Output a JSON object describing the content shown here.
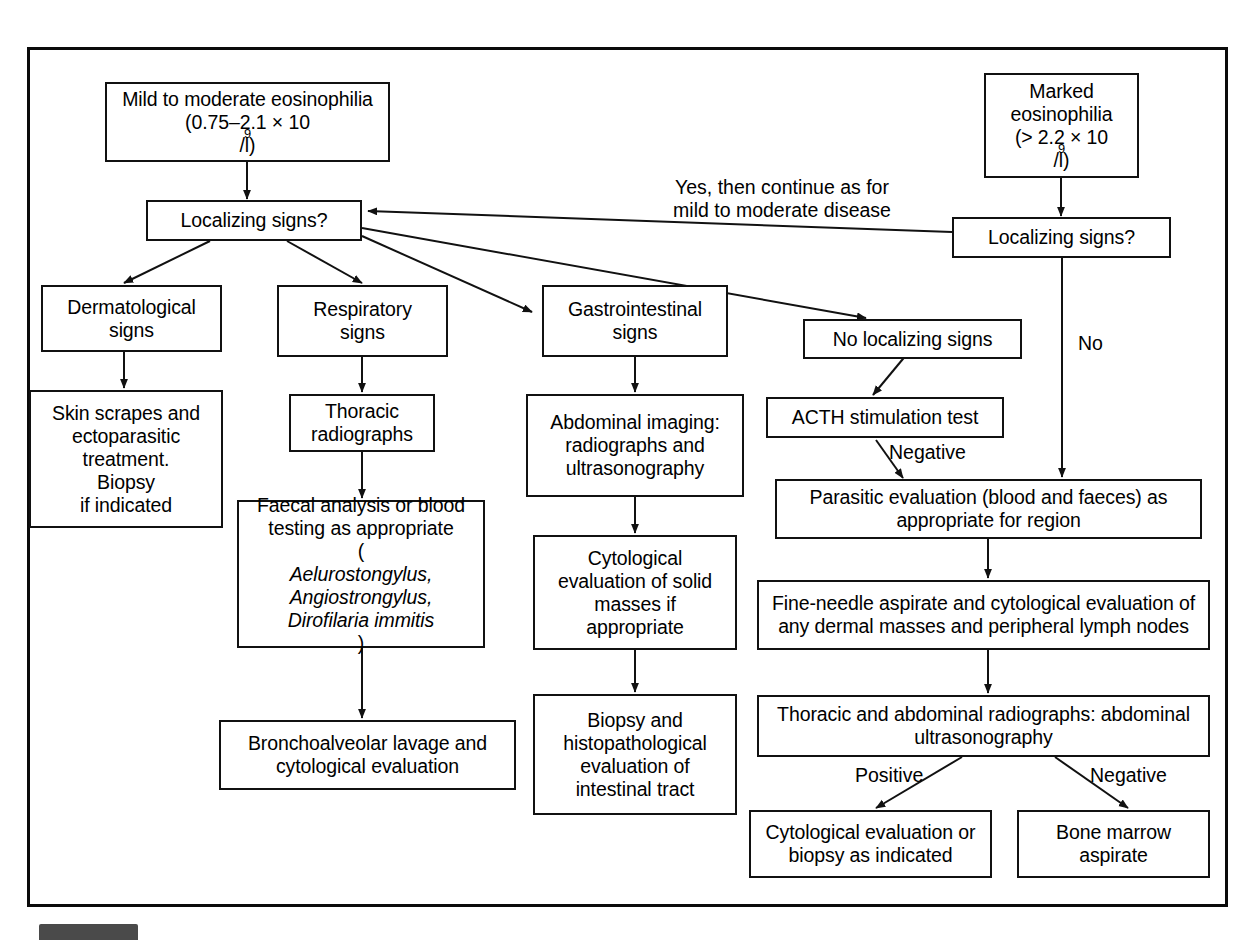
{
  "figure": {
    "type": "clinical-decision-flowchart",
    "title_visible": false,
    "border_color": "#0a0a0a",
    "background": "#ffffff"
  },
  "nodes": {
    "mild_moderate": {
      "line1": "Mild to moderate eosinophilia",
      "line2": "(0.75–2.1 × 10",
      "line2_sup": "9",
      "line2_end": "/l)"
    },
    "marked": {
      "line1": "Marked",
      "line2": "eosinophilia",
      "line3": "(> 2.2 × 10",
      "line3_sup": "9",
      "line3_end": "/l)"
    },
    "localizing_left": {
      "label": "Localizing signs?"
    },
    "localizing_right": {
      "label": "Localizing signs?"
    },
    "dermatological": {
      "line1": "Dermatological",
      "line2": "signs"
    },
    "respiratory": {
      "line1": "Respiratory",
      "line2": "signs"
    },
    "gastrointestinal": {
      "line1": "Gastrointestinal",
      "line2": "signs"
    },
    "no_localizing": {
      "label": "No localizing signs"
    },
    "skin_scrapes": {
      "line1": "Skin scrapes and",
      "line2": "ectoparasitic",
      "line3": "treatment.",
      "line4": "Biopsy",
      "line5": "if indicated"
    },
    "thoracic_radiographs": {
      "line1": "Thoracic",
      "line2": "radiographs"
    },
    "faecal_analysis": {
      "line1": "Faecal analysis or blood",
      "line2": "testing as appropriate",
      "line3_open": "(",
      "line3_italic": "Aelurostongylus,",
      "line4_italic": "Angiostrongylus,",
      "line5_italic": "Dirofilaria immitis",
      "line5_close": ")"
    },
    "bronchoalveolar": {
      "line1": "Bronchoalveolar lavage and",
      "line2": "cytological evaluation"
    },
    "abdominal_imaging": {
      "line1": "Abdominal imaging:",
      "line2": "radiographs and",
      "line3": "ultrasonography"
    },
    "cytological_solid": {
      "line1": "Cytological",
      "line2": "evaluation of solid",
      "line3": "masses if",
      "line4": "appropriate"
    },
    "biopsy_histopath": {
      "line1": "Biopsy and",
      "line2": "histopathological",
      "line3": "evaluation of",
      "line4": "intestinal tract"
    },
    "acth": {
      "label": "ACTH stimulation test"
    },
    "parasitic_eval": {
      "line1": "Parasitic evaluation (blood and faeces) as",
      "line2": "appropriate for region"
    },
    "fine_needle": {
      "line1": "Fine-needle aspirate and cytological evaluation of",
      "line2": "any dermal masses and peripheral lymph nodes"
    },
    "thoracic_abdominal": {
      "line1": "Thoracic and abdominal radiographs: abdominal",
      "line2": "ultrasonography"
    },
    "cytological_or_biopsy": {
      "line1": "Cytological evaluation or",
      "line2": "biopsy as indicated"
    },
    "bone_marrow": {
      "line1": "Bone marrow",
      "line2": "aspirate"
    }
  },
  "edge_labels": {
    "yes_continue": "Yes, then continue as for\nmild to moderate disease",
    "no": "No",
    "negative_acth": "Negative",
    "positive": "Positive",
    "negative_bottom": "Negative"
  }
}
